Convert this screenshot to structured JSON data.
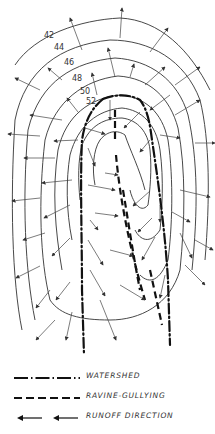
{
  "diagram": {
    "type": "topographic-contour-map",
    "contour_labels": [
      "42",
      "44",
      "46",
      "48",
      "50",
      "52"
    ],
    "features": [
      "watershed lines",
      "ravine-gullying lines",
      "runoff direction arrows"
    ]
  },
  "legend": {
    "items": [
      {
        "symbol": "dash-dot-line",
        "label": "WATERSHED"
      },
      {
        "symbol": "dashed-line",
        "label": "RAVINE-GULLYING"
      },
      {
        "symbol": "arrows",
        "label": "RUNOFF DIRECTION"
      }
    ]
  },
  "colors": {
    "line": "#333333",
    "background": "#ffffff"
  }
}
